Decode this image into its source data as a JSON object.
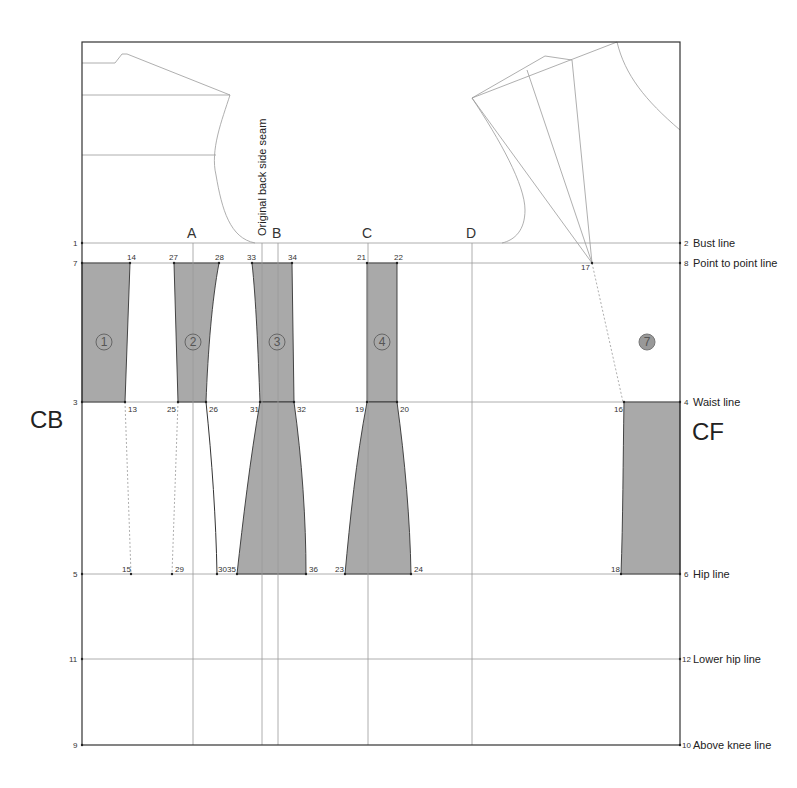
{
  "labels": {
    "cb": "CB",
    "cf": "CF",
    "original_seam": "Original back side seam",
    "guides": [
      "A",
      "B",
      "C",
      "D"
    ]
  },
  "right_lines": [
    {
      "num": "2",
      "label": "Bust line"
    },
    {
      "num": "8",
      "label": "Point to point line"
    },
    {
      "num": "4",
      "label": "Waist line"
    },
    {
      "num": "6",
      "label": "Hip line"
    },
    {
      "num": "12",
      "label": "Lower hip line"
    },
    {
      "num": "10",
      "label": "Above knee line"
    }
  ],
  "left_points": [
    "1",
    "7",
    "3",
    "5",
    "11",
    "9"
  ],
  "panels": [
    "1",
    "2",
    "3",
    "4",
    "7"
  ],
  "points": {
    "p14": "14",
    "p27": "27",
    "p28": "28",
    "p33": "33",
    "p34": "34",
    "p21": "21",
    "p22": "22",
    "p17": "17",
    "p13": "13",
    "p25": "25",
    "p26": "26",
    "p31": "31",
    "p32": "32",
    "p19": "19",
    "p20": "20",
    "p16": "16",
    "p15": "15",
    "p29": "29",
    "p30": "30",
    "p35": "35",
    "p36": "36",
    "p23": "23",
    "p24": "24",
    "p18": "18"
  },
  "colors": {
    "panel_fill": "#a9a9a9",
    "line": "#9a9a9a",
    "frame": "#333333"
  }
}
